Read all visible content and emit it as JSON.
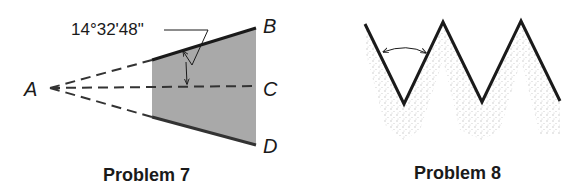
{
  "problem7": {
    "caption": "Problem 7",
    "angle_label": "14°32'48\"",
    "points": {
      "A": "A",
      "B": "B",
      "C": "C",
      "D": "D"
    }
  },
  "problem8": {
    "caption": "Problem 8"
  },
  "colors": {
    "line": "#1a1a1a",
    "shade": "#9a9a9a",
    "stipple": "#b5b5b5",
    "background": "#ffffff"
  }
}
